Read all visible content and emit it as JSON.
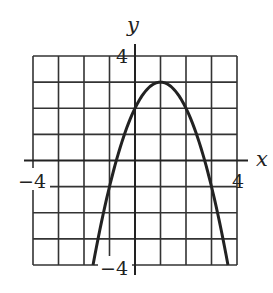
{
  "chart_data": {
    "type": "line",
    "title": "",
    "xlabel": "x",
    "ylabel": "y",
    "xlim": [
      -4,
      4
    ],
    "ylim": [
      -4,
      4
    ],
    "grid": true,
    "grid_step": 1,
    "tick_labels": {
      "x": [
        {
          "value": -4,
          "label": "−4"
        },
        {
          "value": 4,
          "label": "4"
        }
      ],
      "y": [
        {
          "value": 4,
          "label": "4"
        },
        {
          "value": -4,
          "label": "−4"
        }
      ]
    },
    "series": [
      {
        "name": "parabola",
        "equation": "y = -(x - 1)^2 + 3",
        "vertex": [
          1,
          3
        ],
        "x": [
          -1.646,
          -1,
          0,
          1,
          2,
          3,
          3.646
        ],
        "y": [
          -4,
          -1,
          2,
          3,
          2,
          -1,
          -4
        ]
      }
    ],
    "colors": {
      "curve": "#222222",
      "grid": "#333333",
      "background": "#ffffff"
    }
  },
  "labels": {
    "x_axis": "x",
    "y_axis": "y",
    "x_min": "−4",
    "x_max": "4",
    "y_max": "4",
    "y_min": "−4"
  }
}
